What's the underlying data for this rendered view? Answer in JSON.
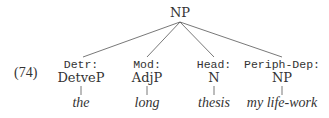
{
  "example_number": "(74)",
  "root": {
    "label": "NP"
  },
  "children": [
    {
      "function": "Detr:",
      "category": "DetveP",
      "word": "the"
    },
    {
      "function": "Mod:",
      "category": "AdjP",
      "word": "long"
    },
    {
      "function": "Head:",
      "category": "N",
      "word": "thesis"
    },
    {
      "function": "Periph-Dep:",
      "category": "NP",
      "word": "my life-work"
    }
  ]
}
